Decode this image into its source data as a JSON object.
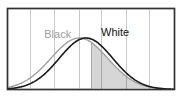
{
  "chart_data": {
    "type": "line",
    "title": "",
    "xlabel": "",
    "ylabel": "",
    "grid": {
      "vertical": true,
      "horizontal": false,
      "count": 6
    },
    "legend_position": "inline-labels",
    "series": [
      {
        "name": "Black",
        "color": "#a0a0a0",
        "mean": 0.43,
        "sd": 0.17,
        "label_pos": [
          0.22,
          0.78
        ]
      },
      {
        "name": "White",
        "color": "#1a1a1a",
        "mean": 0.47,
        "sd": 0.16,
        "label_pos": [
          0.56,
          0.78
        ]
      }
    ],
    "shaded_region": {
      "series": "White",
      "x_from": 0.5,
      "x_to": 1.0,
      "color": "#d6d6d6"
    },
    "xlim": [
      0,
      1
    ],
    "ylim": [
      0,
      1
    ]
  },
  "labels": {
    "black": "Black",
    "white": "White"
  },
  "colors": {
    "frame": "#333333",
    "grid": "#c8c8c8",
    "shade": "#d6d6d6"
  }
}
